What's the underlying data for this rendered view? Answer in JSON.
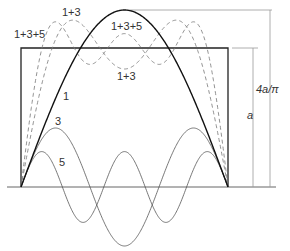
{
  "figure": {
    "labels": {
      "partial_1_3_upper": "1+3",
      "partial_1_3_5_left": "1+3+5",
      "partial_1_3_5_right": "1+3+5",
      "partial_1_3_lower": "1+3",
      "harmonic_1": "1",
      "harmonic_3": "3",
      "harmonic_5": "5",
      "dim_fundamental": "4a/π",
      "dim_square": "a"
    },
    "colors": {
      "square_wave": "#222222",
      "fundamental": "#111111",
      "harmonics": "#555555",
      "partial_sums": "#777777",
      "dimension_lines": "#888888"
    }
  },
  "chart_data": {
    "type": "line",
    "title": "",
    "xlabel": "",
    "ylabel": "",
    "x_range": [
      0,
      3.14159
    ],
    "y_unit": "a",
    "series": [
      {
        "name": "square wave",
        "style": "solid-thick",
        "formula": "a for 0<x<π"
      },
      {
        "name": "1",
        "style": "solid-thick",
        "formula": "(4a/π) sin x",
        "amplitude": 1.273
      },
      {
        "name": "3",
        "style": "solid-thin",
        "formula": "(4a/3π) sin 3x",
        "amplitude": 0.424
      },
      {
        "name": "5",
        "style": "solid-thin",
        "formula": "(4a/5π) sin 5x",
        "amplitude": 0.255
      },
      {
        "name": "1+3",
        "style": "dashed",
        "formula": "(4a/π)(sin x + sin 3x/3)"
      },
      {
        "name": "1+3+5",
        "style": "dashed",
        "formula": "(4a/π)(sin x + sin 3x/3 + sin 5x/5)"
      }
    ],
    "annotations": [
      "a",
      "4a/π"
    ]
  }
}
